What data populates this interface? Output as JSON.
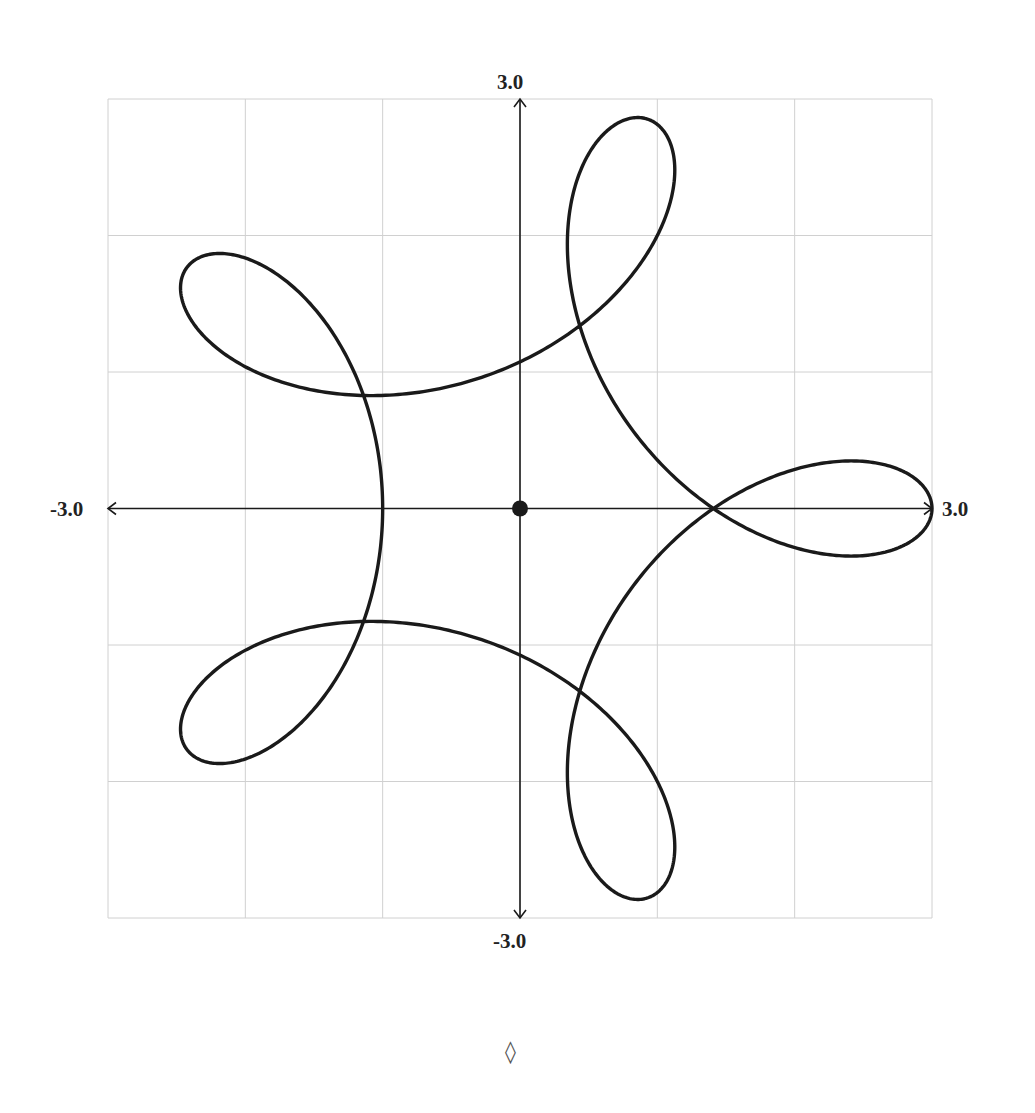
{
  "chart_data": {
    "type": "line",
    "title": "",
    "xlabel": "",
    "ylabel": "",
    "curve": {
      "kind": "parametric",
      "x_expr": "2*cos(t) + cos(4*t)",
      "y_expr": "2*sin(t) - sin(4*t)",
      "t_range": [
        0,
        6.283185
      ],
      "description": "Five-looped hypotrochoid; loop tips at radius 3.0 at angles 0, 72, 144, 216, 288 deg; inner minimum radius 1.0; self-intersections at radius ~1.4",
      "sample_points": [
        {
          "x": 3.0,
          "y": 0.0
        },
        {
          "x": 1.41,
          "y": 0.0
        },
        {
          "x": -1.0,
          "y": 0.0
        },
        {
          "x": 0.93,
          "y": 2.85
        },
        {
          "x": -2.43,
          "y": 1.76
        },
        {
          "x": -2.43,
          "y": -1.76
        },
        {
          "x": 0.93,
          "y": -2.85
        },
        {
          "x": 0.43,
          "y": 1.33
        },
        {
          "x": -1.12,
          "y": 0.82
        },
        {
          "x": 0.0,
          "y": 1.06
        }
      ]
    },
    "origin_marker": {
      "x": 0,
      "y": 0
    },
    "xlim": [
      -3.0,
      3.0
    ],
    "ylim": [
      -3.0,
      3.0
    ],
    "grid": true,
    "grid_step": 1.0,
    "tick_labels": {
      "x_min": "-3.0",
      "x_max": "3.0",
      "y_min": "-3.0",
      "y_max": "3.0"
    },
    "colors": {
      "curve": "#1a1a1a",
      "axes": "#1a1a1a",
      "grid": "#d0d0d0"
    }
  },
  "footer": {
    "mark": "◊"
  }
}
